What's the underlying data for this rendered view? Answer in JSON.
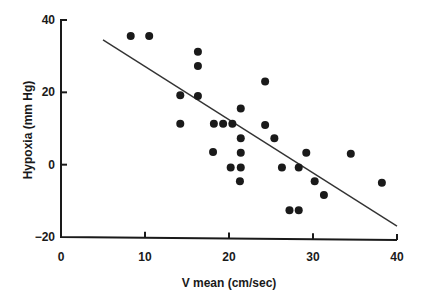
{
  "chart_data": {
    "type": "scatter",
    "title": "",
    "xlabel": "V mean (cm/sec)",
    "ylabel": "Hypoxia (mm Hg)",
    "xlim": [
      0,
      40
    ],
    "ylim": [
      -20,
      40
    ],
    "xticks": [
      "0",
      "10",
      "20",
      "30",
      "40"
    ],
    "yticks": [
      "−20",
      "0",
      "20",
      "40"
    ],
    "grid": false,
    "legend": null,
    "series": [
      {
        "name": "observations",
        "points": [
          {
            "x": 8.3,
            "y": 35.6
          },
          {
            "x": 10.5,
            "y": 35.6
          },
          {
            "x": 16.3,
            "y": 31.2
          },
          {
            "x": 16.3,
            "y": 27.3
          },
          {
            "x": 14.2,
            "y": 19.2
          },
          {
            "x": 16.3,
            "y": 19.0
          },
          {
            "x": 14.2,
            "y": 11.3
          },
          {
            "x": 18.2,
            "y": 11.3
          },
          {
            "x": 19.3,
            "y": 11.3
          },
          {
            "x": 20.4,
            "y": 11.3
          },
          {
            "x": 21.4,
            "y": 15.5
          },
          {
            "x": 24.3,
            "y": 23.0
          },
          {
            "x": 24.3,
            "y": 11.0
          },
          {
            "x": 21.4,
            "y": 7.3
          },
          {
            "x": 25.4,
            "y": 7.3
          },
          {
            "x": 18.1,
            "y": 3.5
          },
          {
            "x": 21.4,
            "y": 3.3
          },
          {
            "x": 29.2,
            "y": 3.3
          },
          {
            "x": 34.5,
            "y": 3.0
          },
          {
            "x": 20.2,
            "y": -0.8
          },
          {
            "x": 21.4,
            "y": -0.8
          },
          {
            "x": 26.3,
            "y": -0.8
          },
          {
            "x": 28.3,
            "y": -0.8
          },
          {
            "x": 21.3,
            "y": -4.6
          },
          {
            "x": 30.2,
            "y": -4.6
          },
          {
            "x": 38.2,
            "y": -5.0
          },
          {
            "x": 31.3,
            "y": -8.4
          },
          {
            "x": 27.2,
            "y": -12.6
          },
          {
            "x": 28.3,
            "y": -12.6
          }
        ]
      }
    ],
    "regression_line": {
      "x1": 5.0,
      "y1": 34.5,
      "x2": 40.0,
      "y2": -17.0
    }
  }
}
